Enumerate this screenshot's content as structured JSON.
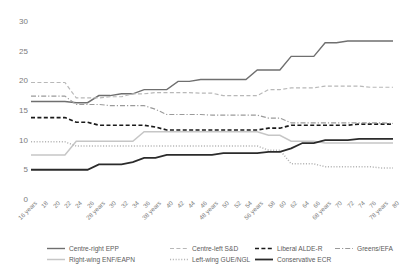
{
  "chart_data": {
    "type": "line",
    "title": "",
    "subtitle": "",
    "xlabel": "",
    "ylabel": "",
    "ylim": [
      0,
      30
    ],
    "yticks": [
      0,
      5,
      10,
      15,
      20,
      25,
      30
    ],
    "grid": false,
    "legend_position": "bottom",
    "x": [
      16,
      18,
      20,
      22,
      24,
      26,
      28,
      30,
      32,
      34,
      36,
      38,
      40,
      42,
      44,
      46,
      48,
      50,
      52,
      54,
      56,
      58,
      60,
      62,
      64,
      66,
      68,
      70,
      72,
      74,
      76,
      78,
      80
    ],
    "categories": [
      "16 years",
      "18",
      "20",
      "22",
      "24",
      "26",
      "28 years",
      "30",
      "32",
      "34",
      "36",
      "38 years",
      "40",
      "42",
      "44",
      "46",
      "48 years",
      "50",
      "52",
      "54",
      "56 years",
      "58",
      "60",
      "62",
      "64",
      "66",
      "68 years",
      "70",
      "72",
      "74",
      "76",
      "78 years",
      "80"
    ],
    "series": [
      {
        "name": "Centre-right EPP",
        "color": "#6f6f6f",
        "dash": "solid",
        "width": 1.4,
        "values": [
          16.6,
          16.6,
          16.6,
          16.6,
          16.4,
          16.4,
          17.6,
          17.6,
          17.9,
          17.9,
          18.6,
          18.6,
          18.6,
          20.0,
          20.0,
          20.3,
          20.3,
          20.3,
          20.3,
          20.3,
          21.9,
          21.9,
          21.9,
          24.2,
          24.2,
          24.2,
          26.5,
          26.5,
          26.8,
          26.8,
          26.8,
          26.8,
          26.8
        ]
      },
      {
        "name": "Centre-left S&D",
        "color": "#b8b8b8",
        "dash": "dashed",
        "width": 1.2,
        "values": [
          19.8,
          19.8,
          19.8,
          19.8,
          17.2,
          17.2,
          17.2,
          17.4,
          17.4,
          17.9,
          17.9,
          18.1,
          18.1,
          18.1,
          18.1,
          18.0,
          18.0,
          17.6,
          17.6,
          17.6,
          17.6,
          18.6,
          18.6,
          18.9,
          18.9,
          18.9,
          19.2,
          19.2,
          19.2,
          19.2,
          19.0,
          19.0,
          19.0
        ]
      },
      {
        "name": "Liberal ALDE-R",
        "color": "#1a1a1a",
        "dash": "dashed",
        "width": 1.7,
        "values": [
          13.9,
          13.9,
          13.9,
          13.9,
          13.1,
          13.1,
          12.6,
          12.6,
          12.6,
          12.6,
          12.6,
          12.3,
          11.8,
          11.8,
          11.8,
          11.8,
          11.8,
          11.8,
          11.8,
          11.8,
          11.8,
          12.1,
          12.1,
          12.6,
          12.6,
          12.6,
          12.6,
          12.6,
          12.6,
          12.8,
          12.8,
          12.8,
          12.8
        ]
      },
      {
        "name": "Greens/EFA",
        "color": "#9a9a9a",
        "dash": "dashdot",
        "width": 1.1,
        "values": [
          17.5,
          17.5,
          17.5,
          17.5,
          16.1,
          16.1,
          16.1,
          15.9,
          15.9,
          15.9,
          15.9,
          15.3,
          14.4,
          14.4,
          14.4,
          14.4,
          14.3,
          14.3,
          14.3,
          14.3,
          14.3,
          13.8,
          13.8,
          13.0,
          13.0,
          13.0,
          13.0,
          13.0,
          13.0,
          13.0,
          13.0,
          13.0,
          12.9
        ]
      },
      {
        "name": "Right-wing ENF/EAPN",
        "color": "#c6c6c6",
        "dash": "solid",
        "width": 1.5,
        "values": [
          7.6,
          7.6,
          7.6,
          7.6,
          9.9,
          9.9,
          9.9,
          9.9,
          9.9,
          9.9,
          11.5,
          11.5,
          11.5,
          11.5,
          11.5,
          11.5,
          11.5,
          11.5,
          11.5,
          11.5,
          11.5,
          10.9,
          10.9,
          9.9,
          9.9,
          9.9,
          9.6,
          9.6,
          9.6,
          9.6,
          9.6,
          9.6,
          9.6
        ]
      },
      {
        "name": "Left-wing GUE/NGL",
        "color": "#b5b5b5",
        "dash": "dotted",
        "width": 1.5,
        "values": [
          9.8,
          9.8,
          9.8,
          9.8,
          9.1,
          9.1,
          9.1,
          9.1,
          9.1,
          9.1,
          9.1,
          9.1,
          9.1,
          9.1,
          9.1,
          9.1,
          9.1,
          9.1,
          9.1,
          9.1,
          9.1,
          8.4,
          8.4,
          6.1,
          6.1,
          6.1,
          5.6,
          5.6,
          5.6,
          5.6,
          5.6,
          5.4,
          5.4
        ]
      },
      {
        "name": "Conservative ECR",
        "color": "#2b2b2b",
        "dash": "solid",
        "width": 1.8,
        "values": [
          5.1,
          5.1,
          5.1,
          5.1,
          5.1,
          5.1,
          6.0,
          6.0,
          6.0,
          6.4,
          7.1,
          7.1,
          7.6,
          7.6,
          7.6,
          7.6,
          7.6,
          7.9,
          7.9,
          7.9,
          7.9,
          8.1,
          8.1,
          8.7,
          9.6,
          9.6,
          10.1,
          10.1,
          10.1,
          10.3,
          10.3,
          10.3,
          10.3
        ]
      }
    ]
  },
  "legend": {
    "items": [
      {
        "label": "Centre-right EPP",
        "series": 0
      },
      {
        "label": "Right-wing ENF/EAPN",
        "series": 4
      },
      {
        "label": "Centre-left S&D",
        "series": 1
      },
      {
        "label": "Left-wing GUE/NGL",
        "series": 5
      },
      {
        "label": "Liberal ALDE-R",
        "series": 2
      },
      {
        "label": "Conservative ECR",
        "series": 6
      },
      {
        "label": "Greens/EFA",
        "series": 3
      }
    ]
  }
}
